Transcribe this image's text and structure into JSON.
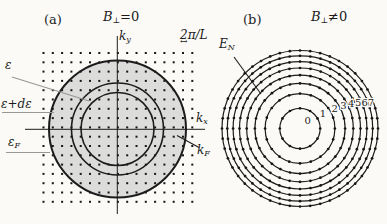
{
  "labels": {
    "panel_a_tag": "(a)",
    "panel_b_tag": "(b)",
    "title_a": {
      "base": "B",
      "sub": "⊥",
      "rest": "=0"
    },
    "title_b": {
      "base": "B",
      "sub": "⊥",
      "rest": "≠0"
    },
    "axis_ky": {
      "base": "k",
      "sub": "y"
    },
    "axis_kx": {
      "base": "k",
      "sub": "x"
    },
    "k_fermi": {
      "base": "k",
      "sub": "F"
    },
    "energy": "ε",
    "energy_shell": "ε+dε",
    "energy_fermi": {
      "base": "ε",
      "sub": "F"
    },
    "grid_spacing": "2π/L",
    "spacing_arrow": "↔",
    "landau_energy": {
      "base": "E",
      "sub": "N"
    },
    "landau_indices": [
      "0",
      "1",
      "2",
      "3",
      "4",
      "5",
      "6",
      "7"
    ]
  },
  "colors": {
    "ink": "#1c1c1c",
    "gray_pointer": "#979797",
    "shade": "#dcdcda",
    "dot": "#161616",
    "background": "#fbfaf7"
  },
  "geometry": {
    "panel_a": {
      "grid": {
        "x0": 43.5,
        "y0": 53,
        "step": 9.3,
        "cols": 17,
        "rows": 17,
        "dot_size": 2
      },
      "center": [
        117.5,
        129
      ],
      "fermi_disk_radius": 68.5,
      "circle_radii": [
        36.5,
        46,
        68.5
      ],
      "circle_widths": [
        1.6,
        1.6,
        2
      ],
      "axis_ky": [
        117.3,
        36,
        117.3,
        214
      ],
      "axis_kx": [
        25,
        129.3,
        205,
        129.3
      ],
      "pointer_epsilon": [
        12,
        77,
        89,
        101
      ],
      "pointer_epsilon_de": [
        2,
        112.5,
        54,
        112.5
      ],
      "pointer_epsilon_f": [
        6,
        152.5,
        50,
        152.5
      ],
      "pointer_k_f": [
        177,
        135.5,
        199,
        147.5
      ]
    },
    "panel_b": {
      "center": [
        300,
        128.5
      ],
      "ring_radii": [
        20.2,
        34.9,
        45.1,
        53.3,
        60.5,
        66.9,
        72.7,
        78.0
      ],
      "ring_dot_counts": [
        12,
        20,
        28,
        32,
        36,
        40,
        44,
        48
      ],
      "ring_dot_radius": 1.35,
      "label_polar": [
        [
          11,
          45
        ],
        [
          27.6,
          34
        ],
        [
          40,
          30
        ],
        [
          49.2,
          28
        ],
        [
          56.9,
          26
        ],
        [
          63.7,
          24
        ],
        [
          69.8,
          22
        ],
        [
          75.4,
          20
        ]
      ],
      "pointer_en": [
        234,
        57,
        261,
        94
      ]
    }
  }
}
